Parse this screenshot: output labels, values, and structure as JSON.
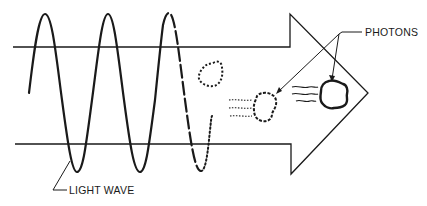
{
  "diagram": {
    "type": "physics-illustration",
    "labels": {
      "photons": "PHOTONS",
      "light_wave": "LIGHT WAVE"
    },
    "colors": {
      "stroke": "#1a1a1a",
      "background": "#ffffff"
    },
    "elements": [
      "arrow-outline",
      "sine-wave-solid",
      "sine-wave-dashed",
      "sine-wave-dotted",
      "photon-dotted",
      "photon-partial",
      "photon-solid",
      "motion-lines"
    ]
  }
}
